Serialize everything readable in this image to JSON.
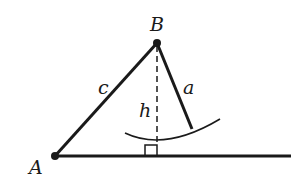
{
  "diagram": {
    "type": "geometry",
    "title": "",
    "points": [
      {
        "id": "A",
        "label": "A",
        "x": 55,
        "y": 156
      },
      {
        "id": "B",
        "label": "B",
        "x": 157,
        "y": 43
      }
    ],
    "segments": [
      {
        "id": "c",
        "label": "c",
        "from": "A",
        "to": "B",
        "style": "solid"
      },
      {
        "id": "a",
        "label": "a",
        "from": "B",
        "to_xy": [
          192,
          129
        ],
        "style": "solid"
      },
      {
        "id": "h",
        "label": "h",
        "from": "B",
        "to_xy": [
          157,
          156
        ],
        "style": "dashed"
      },
      {
        "id": "base",
        "label": "",
        "from": "A",
        "to_xy": [
          291,
          156
        ],
        "style": "solid"
      }
    ],
    "arc": {
      "center": "B",
      "radius_label": "a",
      "description": "arc of radius a centered at B"
    },
    "right_angle_marker": {
      "at": [
        157,
        156
      ]
    },
    "colors": {
      "ink": "#1a1a1a",
      "background": "#ffffff"
    }
  }
}
